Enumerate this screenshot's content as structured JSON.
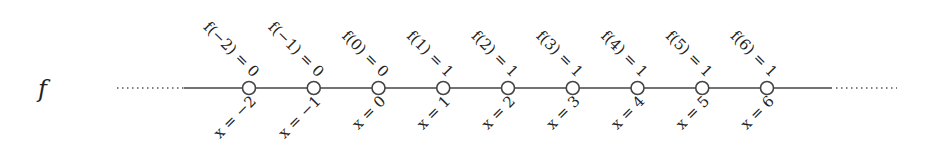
{
  "function_label": "f",
  "nodes": [
    {
      "x_label": "x = −2",
      "f_label": "f(−2) = 0"
    },
    {
      "x_label": "x = −1",
      "f_label": "f(−1) = 0"
    },
    {
      "x_label": "x = 0",
      "f_label": "f(0) = 0"
    },
    {
      "x_label": "x = 1",
      "f_label": "f(1) = 1"
    },
    {
      "x_label": "x = 2",
      "f_label": "f(2) = 1"
    },
    {
      "x_label": "x = 3",
      "f_label": "f(3) = 1"
    },
    {
      "x_label": "x = 4",
      "f_label": "f(4) = 1"
    },
    {
      "x_label": "x = 5",
      "f_label": "f(5) = 1"
    },
    {
      "x_label": "x = 6",
      "f_label": "f(6) = 1"
    }
  ],
  "colors": {
    "line": "#444444",
    "text": "#222222",
    "node_fill": "#ffffff"
  }
}
